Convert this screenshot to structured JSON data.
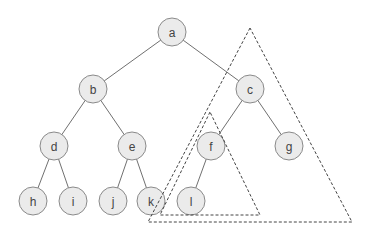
{
  "diagram": {
    "type": "binary-tree",
    "node_radius": 14,
    "colors": {
      "node_fill": "#ebebeb",
      "node_stroke": "#8a8a8a",
      "edge": "#707070",
      "label": "#444444",
      "triangle": "#444444"
    },
    "nodes": [
      {
        "id": "a",
        "label": "a",
        "x": 172,
        "y": 32
      },
      {
        "id": "b",
        "label": "b",
        "x": 93,
        "y": 89
      },
      {
        "id": "c",
        "label": "c",
        "x": 250,
        "y": 89
      },
      {
        "id": "d",
        "label": "d",
        "x": 54,
        "y": 146
      },
      {
        "id": "e",
        "label": "e",
        "x": 132,
        "y": 146
      },
      {
        "id": "f",
        "label": "f",
        "x": 211,
        "y": 146
      },
      {
        "id": "g",
        "label": "g",
        "x": 289,
        "y": 146
      },
      {
        "id": "h",
        "label": "h",
        "x": 33,
        "y": 201
      },
      {
        "id": "i",
        "label": "i",
        "x": 73,
        "y": 201
      },
      {
        "id": "j",
        "label": "j",
        "x": 113,
        "y": 201
      },
      {
        "id": "k",
        "label": "k",
        "x": 151,
        "y": 201
      },
      {
        "id": "l",
        "label": "l",
        "x": 191,
        "y": 201
      }
    ],
    "edges": [
      [
        "a",
        "b"
      ],
      [
        "a",
        "c"
      ],
      [
        "b",
        "d"
      ],
      [
        "b",
        "e"
      ],
      [
        "c",
        "f"
      ],
      [
        "c",
        "g"
      ],
      [
        "d",
        "h"
      ],
      [
        "d",
        "i"
      ],
      [
        "e",
        "j"
      ],
      [
        "e",
        "k"
      ],
      [
        "f",
        "l"
      ]
    ],
    "subtree_triangles": [
      {
        "name": "subtree-c",
        "root": "c",
        "points": [
          [
            250,
            28
          ],
          [
            148,
            222
          ],
          [
            352,
            222
          ]
        ]
      },
      {
        "name": "subtree-f",
        "root": "f",
        "points": [
          [
            210,
            112
          ],
          [
            160,
            215
          ],
          [
            260,
            215
          ]
        ]
      }
    ]
  }
}
